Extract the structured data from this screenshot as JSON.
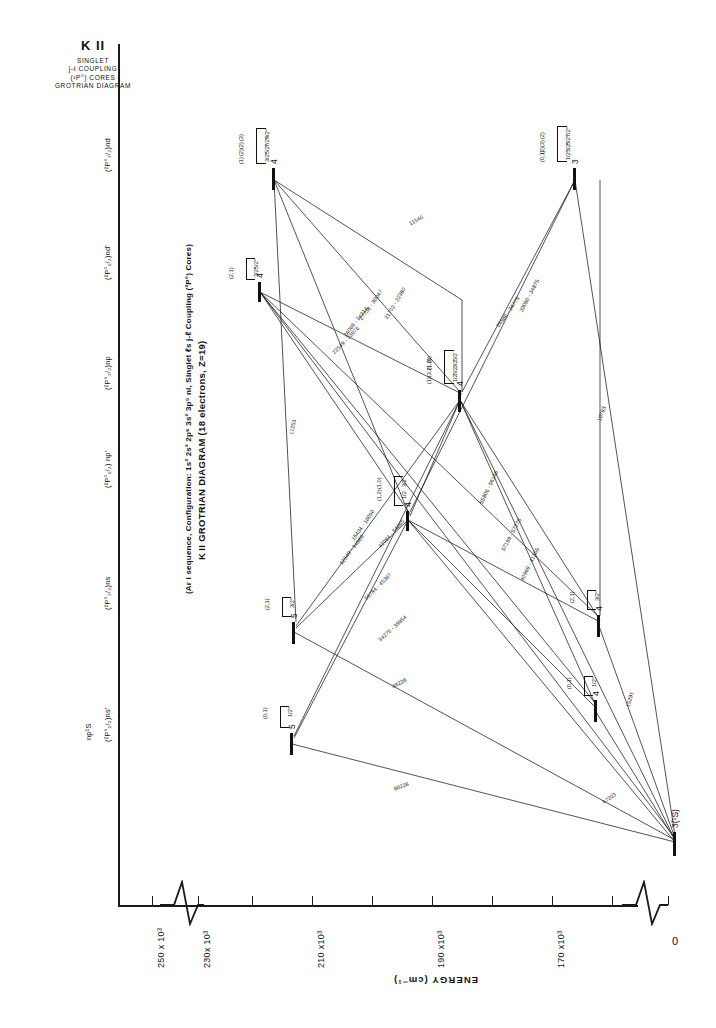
{
  "header": {
    "element": "K II",
    "lines": [
      "SINGLET",
      "j-ℓ COUPLING",
      "(²P°) CORES",
      "GROTRIAN DIAGRAM"
    ]
  },
  "title": {
    "main": "K II GROTRIAN DIAGRAM (18 electrons, Z=19)",
    "sub": "(Ar I sequence, Configuration: 1s² 2s² 2p⁶ 3s² 3p⁵ nl, Singlet  ℓs  j-ℓ Coupling  (²P°) Cores)"
  },
  "axis": {
    "label": "ENERGY  (cm⁻¹)",
    "ticks": [
      {
        "value": "250 x 10³",
        "x": 152
      },
      {
        "value": "230x 10³",
        "x": 198
      },
      {
        "value": "",
        "x": 252
      },
      {
        "value": "210 x10³",
        "x": 312
      },
      {
        "value": "",
        "x": 372
      },
      {
        "value": "190 x10³",
        "x": 432
      },
      {
        "value": "",
        "x": 492
      },
      {
        "value": "170 x10³",
        "x": 552
      },
      {
        "value": "",
        "x": 612
      },
      {
        "value": "0",
        "x": 668
      }
    ]
  },
  "columns": [
    {
      "name": "col-np-S",
      "label": "np¹S",
      "x": 84,
      "y": 740
    },
    {
      "name": "col-p12-ns-prime",
      "label": "(²P°₁/₂)ns'",
      "x": 103,
      "y": 742
    },
    {
      "name": "col-p32-ns",
      "label": "(²P°₃/₂)ns",
      "x": 103,
      "y": 610
    },
    {
      "name": "col-p12-np-prime",
      "label": "(²P°₁/₂) np'",
      "x": 103,
      "y": 488
    },
    {
      "name": "col-p32-np",
      "label": "(²P°₃/₂)np",
      "x": 103,
      "y": 390
    },
    {
      "name": "col-p12-nd-prime",
      "label": "(²P°₁/₂)nd'",
      "x": 103,
      "y": 280
    },
    {
      "name": "col-p32-nd",
      "label": "(²P°₃/₂)nd",
      "x": 103,
      "y": 172
    }
  ],
  "levels": [
    {
      "name": "level-4d-p32",
      "n": "4",
      "bar_x": 272,
      "bar_y": 168,
      "bar_h": 22,
      "bracket_x": 256,
      "bracket_y": 128,
      "bracket_w": 9,
      "bracket_h": 34,
      "terms": [
        {
          "t": "9/2°",
          "j": "(3)"
        },
        {
          "t": "7/2°",
          "j": "(2)"
        },
        {
          "t": "5/2°",
          "j": "(2)"
        },
        {
          "t": "3/2°",
          "j": "(1)"
        }
      ]
    },
    {
      "name": "level-3d-p12",
      "n": "3",
      "bar_x": 573,
      "bar_y": 168,
      "bar_h": 22,
      "bracket_x": 557,
      "bracket_y": 126,
      "bracket_w": 9,
      "bracket_h": 34,
      "terms": [
        {
          "t": "7/2°",
          "j": "(2)"
        },
        {
          "t": "5/2°",
          "j": "(3)"
        },
        {
          "t": "3/2°",
          "j": "(2)"
        },
        {
          "t": "1/2°",
          "j": "(0,1)"
        }
      ]
    },
    {
      "name": "level-4d-prime",
      "n": "4",
      "bar_x": 258,
      "bar_y": 282,
      "bar_h": 20,
      "bracket_x": 246,
      "bracket_y": 258,
      "bracket_w": 8,
      "bracket_h": 20,
      "terms": [
        {
          "t": "5/2°",
          "j": ""
        },
        {
          "t": "3/2°",
          "j": "(2,1)"
        }
      ]
    },
    {
      "name": "level-4p-p32",
      "n": "4",
      "bar_x": 458,
      "bar_y": 390,
      "bar_h": 22,
      "bracket_x": 444,
      "bracket_y": 350,
      "bracket_w": 9,
      "bracket_h": 32,
      "terms": [
        {
          "t": "5/2",
          "j": "(0)"
        },
        {
          "t": "3/2",
          "j": "(1,2)"
        },
        {
          "t": "5/2",
          "j": "(3,2)"
        },
        {
          "t": "1/2",
          "j": "(1)"
        }
      ]
    },
    {
      "name": "level-4p-prime",
      "n": "4",
      "bar_x": 406,
      "bar_y": 511,
      "bar_h": 20,
      "bracket_x": 394,
      "bracket_y": 476,
      "bracket_w": 8,
      "bracket_h": 28,
      "terms": [
        {
          "t": "3/2",
          "j": "(1,0)"
        },
        {
          "t": "1/2",
          "j": "(1,2)"
        }
      ]
    },
    {
      "name": "level-5s-p32",
      "n": "5",
      "bar_x": 292,
      "bar_y": 622,
      "bar_h": 22,
      "bracket_x": 282,
      "bracket_y": 597,
      "bracket_w": 8,
      "bracket_h": 18,
      "terms": [
        {
          "t": "3/2°",
          "j": "(2,1)"
        }
      ]
    },
    {
      "name": "level-4s-p32",
      "n": "4",
      "bar_x": 597,
      "bar_y": 615,
      "bar_h": 22,
      "bracket_x": 587,
      "bracket_y": 590,
      "bracket_w": 8,
      "bracket_h": 18,
      "terms": [
        {
          "t": "3/2°",
          "j": "(2,1)"
        }
      ]
    },
    {
      "name": "level-5s-prime",
      "n": "5",
      "bar_x": 290,
      "bar_y": 733,
      "bar_h": 22,
      "bracket_x": 280,
      "bracket_y": 706,
      "bracket_w": 8,
      "bracket_h": 20,
      "terms": [
        {
          "t": "1/2°",
          "j": "(0,1)"
        }
      ]
    },
    {
      "name": "level-4s-prime",
      "n": "4",
      "bar_x": 594,
      "bar_y": 700,
      "bar_h": 22,
      "bracket_x": 584,
      "bracket_y": 676,
      "bracket_w": 8,
      "bracket_h": 18,
      "terms": [
        {
          "t": "1/2°",
          "j": "(0,1)"
        }
      ]
    },
    {
      "name": "level-ground",
      "n": "3(¹S)",
      "bar_x": 673,
      "bar_y": 832,
      "bar_h": 24,
      "bracket_x": 0,
      "bracket_y": 0,
      "bracket_w": 0,
      "bracket_h": 0,
      "terms": []
    }
  ],
  "transitions": [
    {
      "name": "wl-11540",
      "text": "11540",
      "x": 408,
      "y": 221,
      "rot": -28
    },
    {
      "name": "wl-24580",
      "text": "24580 - 24775",
      "x": 495,
      "y": 325,
      "rot": -55
    },
    {
      "name": "wl-33000",
      "text": "33060 - 34875",
      "x": 518,
      "y": 310,
      "rot": -62
    },
    {
      "name": "wl-10793",
      "text": "10793",
      "x": 596,
      "y": 420,
      "rot": -70
    },
    {
      "name": "wl-21702",
      "text": "21702 - 22380",
      "x": 383,
      "y": 317,
      "rot": -59
    },
    {
      "name": "wl-27738",
      "text": "27738 - 30047",
      "x": 358,
      "y": 318,
      "rot": -55
    },
    {
      "name": "wl-24069",
      "text": "24069 - 24314",
      "x": 342,
      "y": 334,
      "rot": -52
    },
    {
      "name": "wl-22549",
      "text": "22549 - 23976",
      "x": 331,
      "y": 351,
      "rot": -46
    },
    {
      "name": "wl-17253",
      "text": "17253",
      "x": 288,
      "y": 434,
      "rot": -78
    },
    {
      "name": "wl-15434",
      "text": "15434 - 16090",
      "x": 350,
      "y": 538,
      "rot": -55
    },
    {
      "name": "wl-12549",
      "text": "12549 - 14889",
      "x": 338,
      "y": 562,
      "rot": -52
    },
    {
      "name": "wl-42094",
      "text": "42094 - 54895",
      "x": 377,
      "y": 545,
      "rot": -48
    },
    {
      "name": "wl-56784",
      "text": "56784 - 45367",
      "x": 363,
      "y": 597,
      "rot": -45
    },
    {
      "name": "wl-34275",
      "text": "34275 - 39954",
      "x": 377,
      "y": 638,
      "rot": -42
    },
    {
      "name": "wl-48226",
      "text": "48226",
      "x": 391,
      "y": 684,
      "rot": -28
    },
    {
      "name": "wl-80228",
      "text": "80228",
      "x": 393,
      "y": 786,
      "rot": -20
    },
    {
      "name": "wl-57199",
      "text": "57199 - 57275",
      "x": 500,
      "y": 549,
      "rot": -62
    },
    {
      "name": "wl-40969",
      "text": "40969 - 41355",
      "x": 519,
      "y": 579,
      "rot": -64
    },
    {
      "name": "wl-55806",
      "text": "55806 - 56166",
      "x": 478,
      "y": 502,
      "rot": -64
    },
    {
      "name": "wl-15291",
      "text": "15291",
      "x": 625,
      "y": 706,
      "rot": -76
    },
    {
      "name": "wl-47203",
      "text": "47203",
      "x": 601,
      "y": 800,
      "rot": -35
    }
  ],
  "colors": {
    "ink": "#1a1a1a",
    "paper": "#ffffff"
  }
}
